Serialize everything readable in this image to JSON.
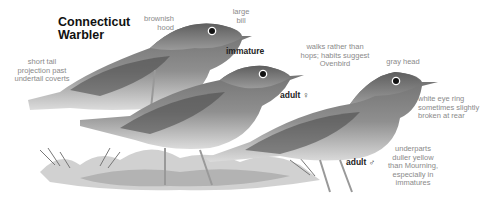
{
  "title": {
    "line1": "Connecticut",
    "line2": "Warbler"
  },
  "birds": [
    {
      "id": "immature",
      "label": "immature"
    },
    {
      "id": "adult-female",
      "label": "adult ♀"
    },
    {
      "id": "adult-male",
      "label": "adult ♂"
    }
  ],
  "annotations": {
    "brownish_hood": [
      "brownish",
      "hood"
    ],
    "large_bill": [
      "large",
      "bill"
    ],
    "short_tail": [
      "short tail",
      "projection past",
      "undertail coverts"
    ],
    "walks": [
      "walks rather than",
      "hops; habits suggest",
      "Ovenbird"
    ],
    "gray_head": [
      "gray head"
    ],
    "eye_ring": [
      "white eye ring",
      "sometimes slightly",
      "broken at rear"
    ],
    "underparts": [
      "underparts",
      "duller yellow",
      "than Mourning,",
      "especially in",
      "immatures"
    ]
  },
  "colors": {
    "annotation_text": "#8a8a8a",
    "title_text": "#111111",
    "bird_dark": "#5a5a5a",
    "bird_mid": "#8c8c8c",
    "bird_light": "#d6d6d6"
  }
}
